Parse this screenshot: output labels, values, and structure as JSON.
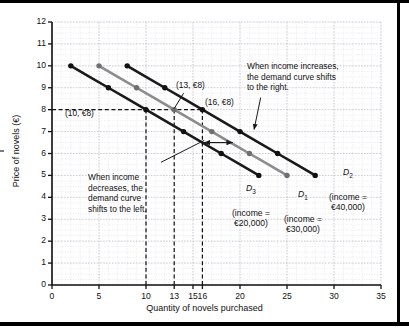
{
  "chart_data": {
    "type": "line",
    "title": "",
    "xlabel": "Quantity of novels purchased",
    "ylabel": "Price of novels (€)",
    "xlim": [
      0,
      35
    ],
    "ylim": [
      0,
      12
    ],
    "xticks": [
      0,
      5,
      10,
      13,
      15,
      16,
      20,
      25,
      30,
      35
    ],
    "yticks": [
      0,
      1,
      2,
      3,
      4,
      5,
      6,
      7,
      8,
      9,
      10,
      11,
      12
    ],
    "grid": true,
    "legend_position": "inline-labels",
    "series": [
      {
        "name": "D3",
        "label": "D",
        "subscript": "3",
        "income_text": "(income =\n€20,000)",
        "color": "#1a1a1a",
        "x": [
          2,
          4,
          6,
          8,
          10,
          12,
          14,
          16,
          18,
          20,
          22
        ],
        "y": [
          10,
          9.5,
          9,
          8.5,
          8,
          7.5,
          7,
          6.5,
          6,
          5.5,
          5
        ],
        "markers_x": [
          2,
          4,
          6,
          8,
          10,
          12,
          14,
          16,
          18,
          20,
          22
        ],
        "markers_y": [
          10,
          9.5,
          9,
          8.5,
          8,
          7.5,
          7,
          6.5,
          6,
          5.5,
          5
        ]
      },
      {
        "name": "D1",
        "label": "D",
        "subscript": "1",
        "income_text": "(income =\n€30,000)",
        "color": "#8c8c8c",
        "x": [
          5,
          7,
          9,
          11,
          13,
          15,
          17,
          19,
          21,
          23,
          25
        ],
        "y": [
          10,
          9.5,
          9,
          8.5,
          8,
          7.5,
          7,
          6.5,
          6,
          5.5,
          5
        ],
        "markers_x": [
          5,
          7,
          9,
          11,
          13,
          15,
          17,
          19,
          21,
          23,
          25
        ],
        "markers_y": [
          10,
          9.5,
          9,
          8.5,
          8,
          7.5,
          7,
          6.5,
          6,
          5.5,
          5
        ]
      },
      {
        "name": "D2",
        "label": "D",
        "subscript": "2",
        "income_text": "(income =\n€40,000)",
        "color": "#1a1a1a",
        "x": [
          8,
          10,
          12,
          14,
          16,
          18,
          20,
          22,
          24,
          26,
          28
        ],
        "y": [
          10,
          9.5,
          9,
          8.5,
          8,
          7.5,
          7,
          6.5,
          6,
          5.5,
          5
        ],
        "markers_x": [
          8,
          10,
          12,
          14,
          16,
          18,
          20,
          22,
          24,
          26,
          28
        ],
        "markers_y": [
          10,
          9.5,
          9,
          8.5,
          8,
          7.5,
          7,
          6.5,
          6,
          5.5,
          5
        ]
      }
    ],
    "reference_lines": {
      "horizontal": [
        {
          "y": 8,
          "style": "dashed",
          "from_x": 0,
          "to_x": 16
        }
      ],
      "vertical": [
        {
          "x": 10,
          "style": "dashed",
          "from_y": 0,
          "to_y": 8
        },
        {
          "x": 13,
          "style": "dashed",
          "from_y": 0,
          "to_y": 8
        },
        {
          "x": 16,
          "style": "dashed",
          "from_y": 0,
          "to_y": 8
        }
      ]
    },
    "annotated_points": [
      {
        "label": "(10, €8)",
        "x": 10,
        "y": 8,
        "series": "D3"
      },
      {
        "label": "(13, €8)",
        "x": 13,
        "y": 8,
        "series": "D1"
      },
      {
        "label": "(16, €8)",
        "x": 16,
        "y": 8,
        "series": "D2"
      }
    ],
    "annotations": [
      {
        "id": "increase",
        "text": "When income increases,\nthe demand curve shifts\nto the right.",
        "arrow_to_x": 21.5,
        "arrow_to_y": 7.1
      },
      {
        "id": "decrease",
        "text": "When income\ndecreases, the\ndemand curve\nshifts to the left.",
        "arrow_to_x": 16.2,
        "arrow_to_y": 6.6
      }
    ],
    "shift_arrows": [
      {
        "direction": "left",
        "y": 6.5,
        "from_x": 19.2,
        "to_x": 16.2
      },
      {
        "direction": "right",
        "y": 6.5,
        "from_x": 16.2,
        "to_x": 19.2
      }
    ]
  },
  "axes": {
    "x_title": "Quantity of novels purchased",
    "y_title": "Price of novels (€)",
    "x_tick_labels": [
      "0",
      "5",
      "10",
      "13",
      "15",
      "16",
      "20",
      "25",
      "30",
      "35"
    ],
    "y_tick_labels": [
      "0",
      "1",
      "2",
      "3",
      "4",
      "5",
      "6",
      "7",
      "8",
      "9",
      "10",
      "11",
      "12"
    ]
  },
  "labels": {
    "point_10": "(10, €8)",
    "point_13": "(13, €8)",
    "point_16": "(16, €8)",
    "anno_increase": "When income increases, the demand curve shifts to the right.",
    "anno_decrease": "When income decreases, the demand curve shifts to the left.",
    "d3_income": "(income =\n€20,000)",
    "d1_income": "(income =\n€30,000)",
    "d2_income": "(income =\n€40,000)"
  },
  "colors": {
    "curve_dark": "#1a1a1a",
    "curve_gray": "#8c8c8c",
    "grid": "#c9c9d4",
    "axis": "#111111",
    "background": "#ffffff"
  }
}
